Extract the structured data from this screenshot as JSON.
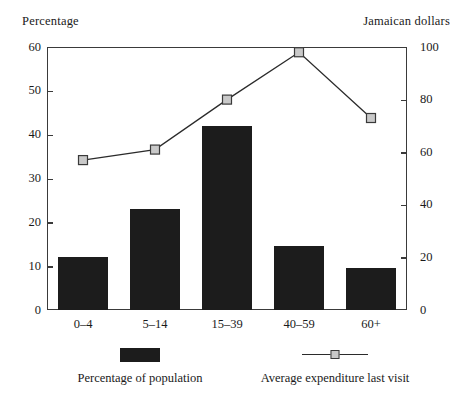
{
  "chart_data": {
    "type": "bar",
    "title": "",
    "categories": [
      "0–4",
      "5–14",
      "15–39",
      "40–59",
      "60+"
    ],
    "xlabel": "",
    "ylabel": "Percentage",
    "y2label": "Jamaican dollars",
    "ylim": [
      0,
      60
    ],
    "y2lim": [
      0,
      100
    ],
    "yticks": [
      0,
      10,
      20,
      30,
      40,
      50,
      60
    ],
    "y2ticks": [
      0,
      20,
      40,
      60,
      80,
      100
    ],
    "ytick_labels": [
      "0",
      "10",
      "20",
      "30",
      "40",
      "50",
      "60"
    ],
    "y2tick_labels": [
      "0",
      "20",
      "40",
      "60",
      "80",
      "100"
    ],
    "grid": false,
    "legend_position": "bottom",
    "series": [
      {
        "name": "Percentage of population",
        "type": "bar",
        "axis": "left",
        "color": "#1c1c1c",
        "values": [
          12,
          23,
          42,
          14.5,
          9.5
        ]
      },
      {
        "name": "Average expenditure last visit",
        "type": "line",
        "axis": "right",
        "color": "#2b2b2b",
        "marker_fill": "#c9c9c9",
        "values": [
          57,
          61,
          80,
          98,
          73
        ]
      }
    ]
  },
  "axes": {
    "left_title": "Percentage",
    "right_title": "Jamaican dollars"
  },
  "legend": {
    "items": [
      {
        "label": "Percentage of population",
        "marker": "bar-swatch"
      },
      {
        "label": "Average expenditure last visit",
        "marker": "line-swatch"
      }
    ]
  }
}
